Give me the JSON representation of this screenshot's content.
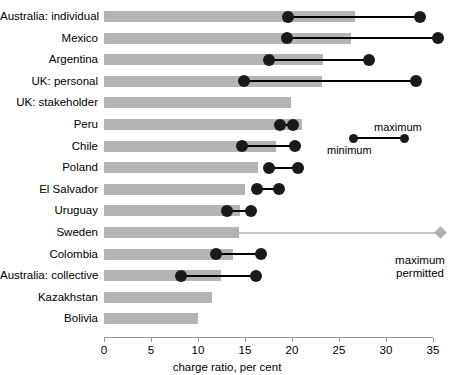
{
  "chart_data": {
    "type": "bar",
    "title": "",
    "xlabel": "charge ratio, per cent",
    "ylabel": "",
    "xlim": [
      0,
      35
    ],
    "xticks": [
      0,
      5,
      10,
      15,
      20,
      25,
      30,
      35
    ],
    "xticklabels": [
      "0",
      "5",
      "10",
      "15",
      "20",
      "25",
      "30",
      "35"
    ],
    "grid": false,
    "legend": {
      "minimum_label": "minimum",
      "maximum_label": "maximum",
      "permitted_label_line1": "maximum",
      "permitted_label_line2": "permitted"
    },
    "categories": [
      "Australia: individual",
      "Mexico",
      "Argentina",
      "UK: personal",
      "UK: stakeholder",
      "Peru",
      "Chile",
      "Poland",
      "El Salvador",
      "Uruguay",
      "Sweden",
      "Colombia",
      "Australia: collective",
      "Kazakhstan",
      "Bolivia"
    ],
    "series": [
      {
        "name": "charge ratio",
        "values": [
          26.7,
          26.3,
          23.3,
          23.2,
          19.9,
          21.1,
          18.3,
          16.4,
          15.0,
          14.5,
          14.4,
          13.7,
          12.4,
          11.5,
          10.0
        ]
      },
      {
        "name": "minimum",
        "values": [
          19.6,
          19.5,
          17.5,
          14.9,
          null,
          18.7,
          14.7,
          17.5,
          16.3,
          13.1,
          null,
          11.9,
          8.2,
          null,
          null
        ]
      },
      {
        "name": "maximum",
        "values": [
          33.6,
          35.5,
          28.2,
          33.2,
          null,
          20.1,
          20.3,
          20.6,
          18.6,
          15.6,
          null,
          16.7,
          16.2,
          null,
          null
        ]
      },
      {
        "name": "maximum permitted",
        "values": [
          null,
          null,
          null,
          null,
          null,
          null,
          null,
          null,
          null,
          null,
          35.8,
          null,
          null,
          null,
          null
        ]
      }
    ],
    "colors": {
      "bar": "#b4b4b4",
      "marker": "#1a1a1a",
      "permitted": "#b0b0b0",
      "axis": "#9a9a9a"
    }
  }
}
